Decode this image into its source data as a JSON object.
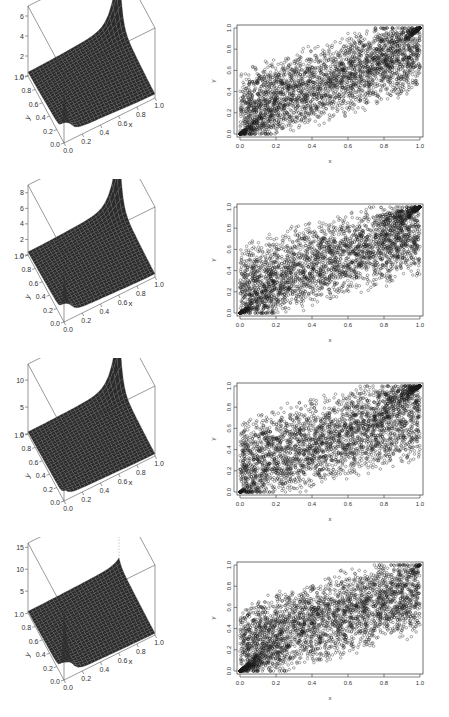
{
  "chart_data": [
    {
      "panel": 1,
      "persp": {
        "type": "surface",
        "xlabel": "x",
        "ylabel": "y",
        "zlabel": "",
        "x_ticks": [
          "0.0",
          "0.2",
          "0.4",
          "0.6",
          "0.8",
          "1.0"
        ],
        "y_ticks": [
          "0.0",
          "0.2",
          "0.4",
          "0.6",
          "0.8",
          "1.0"
        ],
        "z_ticks": [
          "0",
          "2",
          "4",
          "6"
        ],
        "zlim": [
          0,
          7
        ],
        "peak_corner": "(1,1) high, (0,0) moderate",
        "peaks": {
          "far": 7,
          "near": 4
        }
      },
      "scatter": {
        "type": "scatter",
        "xlabel": "x",
        "ylabel": "y",
        "x_ticks": [
          "0.0",
          "0.2",
          "0.4",
          "0.6",
          "0.8",
          "1.0"
        ],
        "y_ticks": [
          "0.0",
          "0.2",
          "0.4",
          "0.6",
          "0.8",
          "1.0"
        ],
        "xlim": [
          0,
          1
        ],
        "ylim": [
          0,
          1
        ],
        "n_points": 5000,
        "dependence": 0.55,
        "lower_tail": 0.5,
        "upper_tail": 0.7,
        "seed": 11
      }
    },
    {
      "panel": 2,
      "persp": {
        "type": "surface",
        "xlabel": "x",
        "ylabel": "y",
        "zlabel": "",
        "x_ticks": [
          "0.0",
          "0.2",
          "0.4",
          "0.6",
          "0.8",
          "1.0"
        ],
        "y_ticks": [
          "0.0",
          "0.2",
          "0.4",
          "0.6",
          "0.8",
          "1.0"
        ],
        "z_ticks": [
          "0",
          "2",
          "4",
          "6",
          "8"
        ],
        "zlim": [
          0,
          9
        ],
        "peaks": {
          "far": 9,
          "near": 5
        }
      },
      "scatter": {
        "type": "scatter",
        "xlabel": "x",
        "ylabel": "y",
        "x_ticks": [
          "0.0",
          "0.2",
          "0.4",
          "0.6",
          "0.8",
          "1.0"
        ],
        "y_ticks": [
          "0.0",
          "0.2",
          "0.4",
          "0.6",
          "0.8",
          "1.0"
        ],
        "xlim": [
          0,
          1
        ],
        "ylim": [
          0,
          1
        ],
        "n_points": 5000,
        "dependence": 0.5,
        "lower_tail": 0.55,
        "upper_tail": 0.75,
        "seed": 23
      }
    },
    {
      "panel": 3,
      "persp": {
        "type": "surface",
        "xlabel": "x",
        "ylabel": "y",
        "zlabel": "",
        "x_ticks": [
          "0.0",
          "0.2",
          "0.4",
          "0.6",
          "0.8",
          "1.0"
        ],
        "y_ticks": [
          "0.0",
          "0.2",
          "0.4",
          "0.6",
          "0.8",
          "1.0"
        ],
        "z_ticks": [
          "0",
          "5",
          "10"
        ],
        "zlim": [
          0,
          13
        ],
        "peaks": {
          "far": 13,
          "near": 1.5
        }
      },
      "scatter": {
        "type": "scatter",
        "xlabel": "x",
        "ylabel": "y",
        "x_ticks": [
          "0.0",
          "0.2",
          "0.4",
          "0.6",
          "0.8",
          "1.0"
        ],
        "y_ticks": [
          "0.0",
          "0.2",
          "0.4",
          "0.6",
          "0.8",
          "1.0"
        ],
        "xlim": [
          0,
          1
        ],
        "ylim": [
          0,
          1
        ],
        "n_points": 5000,
        "dependence": 0.45,
        "lower_tail": 0.2,
        "upper_tail": 0.8,
        "seed": 37
      }
    },
    {
      "panel": 4,
      "persp": {
        "type": "surface",
        "xlabel": "x",
        "ylabel": "y",
        "zlabel": "",
        "x_ticks": [
          "0.0",
          "0.2",
          "0.4",
          "0.6",
          "0.8",
          "1.0"
        ],
        "y_ticks": [
          "0.0",
          "0.2",
          "0.4",
          "0.6",
          "0.8",
          "1.0"
        ],
        "z_ticks": [
          "5",
          "10",
          "15"
        ],
        "zlim": [
          0,
          16
        ],
        "peaks": {
          "far": 1.5,
          "near": 16
        }
      },
      "scatter": {
        "type": "scatter",
        "xlabel": "x",
        "ylabel": "y",
        "x_ticks": [
          "0.0",
          "0.2",
          "0.4",
          "0.6",
          "0.8",
          "1.0"
        ],
        "y_ticks": [
          "0.0",
          "0.2",
          "0.4",
          "0.6",
          "0.8",
          "1.0"
        ],
        "xlim": [
          0,
          1
        ],
        "ylim": [
          0,
          1
        ],
        "n_points": 5000,
        "dependence": 0.5,
        "lower_tail": 0.85,
        "upper_tail": 0.1,
        "seed": 53
      }
    }
  ],
  "colors": {
    "surface": "#2b2b2b",
    "mesh": "#5a5a5a",
    "axis": "#555555",
    "point": "#1a1a1a"
  }
}
